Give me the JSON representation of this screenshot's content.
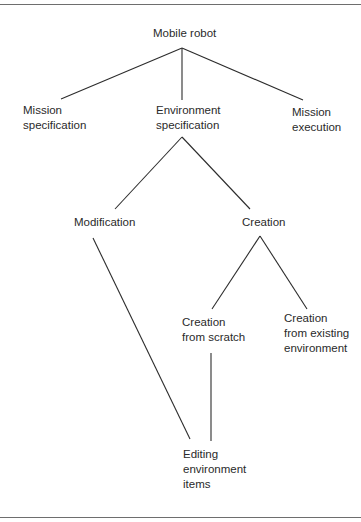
{
  "diagram": {
    "type": "tree",
    "nodes": [
      {
        "id": "root",
        "lines": [
          "Mobile robot"
        ]
      },
      {
        "id": "mission_spec",
        "lines": [
          "Mission",
          "specification"
        ]
      },
      {
        "id": "env_spec",
        "lines": [
          "Environment",
          "specification"
        ]
      },
      {
        "id": "mission_exec",
        "lines": [
          "Mission",
          "execution"
        ]
      },
      {
        "id": "modification",
        "lines": [
          "Modification"
        ]
      },
      {
        "id": "creation",
        "lines": [
          "Creation"
        ]
      },
      {
        "id": "creation_scratch",
        "lines": [
          "Creation",
          "from scratch"
        ]
      },
      {
        "id": "creation_existing",
        "lines": [
          "Creation",
          "from existing",
          "environment"
        ]
      },
      {
        "id": "editing_items",
        "lines": [
          "Editing",
          "environment",
          "items"
        ]
      }
    ],
    "edges": [
      [
        "root",
        "mission_spec"
      ],
      [
        "root",
        "env_spec"
      ],
      [
        "root",
        "mission_exec"
      ],
      [
        "env_spec",
        "modification"
      ],
      [
        "env_spec",
        "creation"
      ],
      [
        "creation",
        "creation_scratch"
      ],
      [
        "creation",
        "creation_existing"
      ],
      [
        "modification",
        "editing_items"
      ],
      [
        "creation_scratch",
        "editing_items"
      ]
    ]
  },
  "labels": {
    "root": [
      "Mobile robot"
    ],
    "mission_spec": [
      "Mission",
      "specification"
    ],
    "env_spec": [
      "Environment",
      "specification"
    ],
    "mission_exec": [
      "Mission",
      "execution"
    ],
    "modification": [
      "Modification"
    ],
    "creation": [
      "Creation"
    ],
    "creation_scratch": [
      "Creation",
      "from scratch"
    ],
    "creation_existing": [
      "Creation",
      "from existing",
      "environment"
    ],
    "editing_items": [
      "Editing",
      "environment",
      "items"
    ]
  },
  "colors": {
    "line": "#2c2c2c",
    "text": "#2a2a2a",
    "rule": "#6e6e6e",
    "background": "#ffffff"
  }
}
